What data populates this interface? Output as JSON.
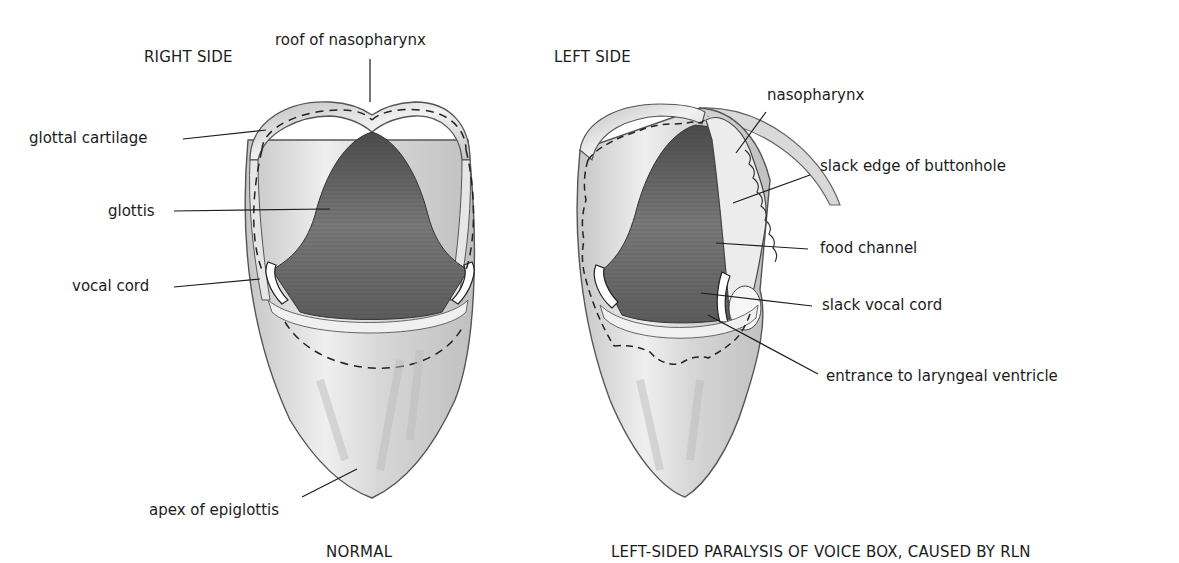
{
  "figure": {
    "panels": [
      {
        "id": "normal",
        "side_heading": "RIGHT SIDE",
        "caption": "NORMAL",
        "labels": [
          "roof of nasopharynx",
          "glottal cartilage",
          "glottis",
          "vocal cord",
          "apex of epiglottis"
        ]
      },
      {
        "id": "paralysis",
        "side_heading": "LEFT SIDE",
        "caption": "LEFT-SIDED PARALYSIS OF VOICE BOX, CAUSED BY RLN",
        "labels": [
          "nasopharynx",
          "slack edge of buttonhole",
          "food channel",
          "slack vocal cord",
          "entrance to laryngeal ventricle"
        ]
      }
    ]
  },
  "colors": {
    "background": "#ffffff",
    "ink": "#1c1c1c",
    "glottis_shade": "#6e6e6e",
    "cartilage_shade": "#d8d8d8"
  }
}
